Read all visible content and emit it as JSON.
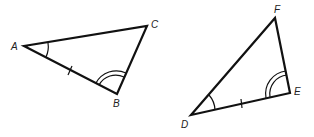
{
  "diagram": {
    "triangle_abc": {
      "vertices": {
        "A": "A",
        "B": "B",
        "C": "C"
      },
      "marks": {
        "angle_A": "single arc",
        "angle_B": "double arc",
        "side_AB": "single tick"
      }
    },
    "triangle_def": {
      "vertices": {
        "D": "D",
        "E": "E",
        "F": "F"
      },
      "marks": {
        "angle_D": "single arc",
        "angle_E": "double arc",
        "side_DE": "single tick"
      }
    }
  }
}
